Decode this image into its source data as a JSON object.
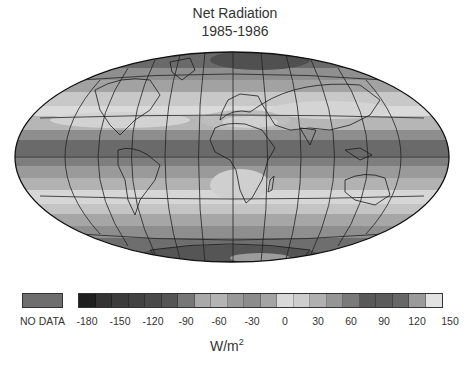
{
  "title": "Net Radiation",
  "subtitle": "1985-1986",
  "chart_data": {
    "type": "heatmap",
    "projection": "Hammer-Aitoff (global, equal-area ellipse)",
    "title": "Net Radiation",
    "subtitle": "1985-1986",
    "units": "W/m²",
    "colorbar": {
      "no_data_label": "NO DATA",
      "no_data_color": "#6e6e6e",
      "tick_labels": [
        "-180",
        "-150",
        "-120",
        "-90",
        "-60",
        "-30",
        "0",
        "30",
        "60",
        "90",
        "120",
        "150"
      ],
      "tick_values": [
        -180,
        -150,
        -120,
        -90,
        -60,
        -30,
        0,
        30,
        60,
        90,
        120,
        150
      ],
      "range": [
        -180,
        150
      ],
      "bin_width": 15,
      "bin_colors": [
        "#1e1e1e",
        "#333333",
        "#3c3c3c",
        "#424242",
        "#4a4a4a",
        "#555555",
        "#777777",
        "#a9a9a9",
        "#b4b4b4",
        "#999999",
        "#8c8c8c",
        "#a4a4a4",
        "#d9d9d9",
        "#cdcdcd",
        "#b0b0b0",
        "#959595",
        "#7a7a7a",
        "#595959",
        "#5c5c5c",
        "#676767",
        "#9a9a9a",
        "#e2e2e2"
      ]
    },
    "latitude_bands_description": [
      {
        "region": "Arctic / high northern latitudes",
        "approx_value": -90
      },
      {
        "region": "Northern mid-latitudes (~50N)",
        "approx_value": -30
      },
      {
        "region": "Northern subtropics (~30N)",
        "approx_value": 0
      },
      {
        "region": "Sahara / Arabian desert",
        "approx_value": -30
      },
      {
        "region": "Equatorial band (tropical oceans)",
        "approx_value": 90
      },
      {
        "region": "Southern subtropics (~20-30S)",
        "approx_value": 30
      },
      {
        "region": "Southern mid-latitudes (~40-50S)",
        "approx_value": -30
      },
      {
        "region": "Antarctica",
        "approx_value": -90
      }
    ],
    "grid": true,
    "legend_position": "bottom"
  }
}
